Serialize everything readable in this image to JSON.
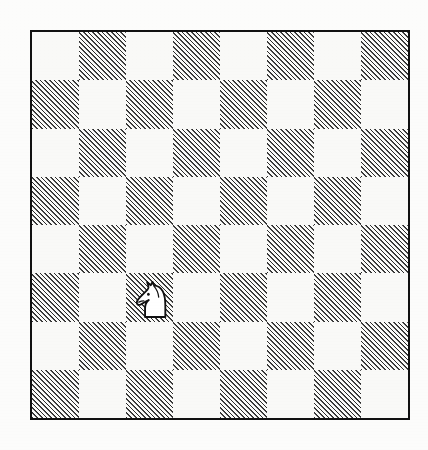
{
  "scene": {
    "title": "Chess Diagram",
    "width": 428,
    "height": 450,
    "background_color": "#fcfcfb"
  },
  "board": {
    "name": "chessboard",
    "rows": 8,
    "columns": 8,
    "orientation": "white-at-bottom",
    "files": [
      "a",
      "b",
      "c",
      "d",
      "e",
      "f",
      "g",
      "h"
    ],
    "ranks": [
      "8",
      "7",
      "6",
      "5",
      "4",
      "3",
      "2",
      "1"
    ],
    "border_color": "#111111",
    "border_width_px": 2,
    "light_square_color": "#f9f9f7",
    "dark_square_style": "diagonal-hatch-45deg",
    "dark_square_hatch_color": "#2a2a2a",
    "top_left_square_shade": "light",
    "bottom_left_square_shade": "dark",
    "squares": [
      [
        "light",
        "dark",
        "light",
        "dark",
        "light",
        "dark",
        "light",
        "dark"
      ],
      [
        "dark",
        "light",
        "dark",
        "light",
        "dark",
        "light",
        "dark",
        "light"
      ],
      [
        "light",
        "dark",
        "light",
        "dark",
        "light",
        "dark",
        "light",
        "dark"
      ],
      [
        "dark",
        "light",
        "dark",
        "light",
        "dark",
        "light",
        "dark",
        "light"
      ],
      [
        "light",
        "dark",
        "light",
        "dark",
        "light",
        "dark",
        "light",
        "dark"
      ],
      [
        "dark",
        "light",
        "dark",
        "light",
        "dark",
        "light",
        "dark",
        "light"
      ],
      [
        "light",
        "dark",
        "light",
        "dark",
        "light",
        "dark",
        "light",
        "dark"
      ],
      [
        "dark",
        "light",
        "dark",
        "light",
        "dark",
        "light",
        "dark",
        "light"
      ]
    ]
  },
  "pieces": [
    {
      "id": "knight-c3",
      "type": "knight",
      "color": "white",
      "symbol": "N",
      "square": "c3",
      "file_index": 2,
      "rank_index": 5,
      "facing": "left",
      "fill": "#ffffff",
      "stroke": "#111111"
    }
  ],
  "legend": {
    "dark_square_label": "hatched square",
    "light_square_label": "plain square",
    "piece_label": "white knight"
  }
}
